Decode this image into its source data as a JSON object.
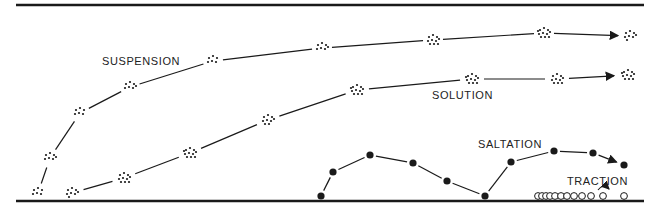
{
  "diagram": {
    "labels": {
      "suspension": "SUSPENSION",
      "solution": "SOLUTION",
      "saltation": "SALTATION",
      "traction": "TRACTION"
    },
    "colors": {
      "ink": "#1a1a1a",
      "background": "#ffffff"
    },
    "lines": {
      "top_y": 5,
      "bottom_y": 201,
      "x_start": 16,
      "x_end": 644
    },
    "suspension_clusters": [
      [
        38,
        193
      ],
      [
        50,
        158
      ],
      [
        80,
        113
      ],
      [
        130,
        87
      ],
      [
        213,
        61
      ],
      [
        322,
        48
      ],
      [
        433,
        40
      ],
      [
        544,
        33
      ],
      [
        630,
        36
      ]
    ],
    "solution_clusters": [
      [
        72,
        193
      ],
      [
        124,
        178
      ],
      [
        190,
        153
      ],
      [
        268,
        120
      ],
      [
        357,
        90
      ],
      [
        472,
        79
      ],
      [
        557,
        79
      ],
      [
        628,
        75
      ]
    ],
    "saltation_points": [
      [
        321,
        196
      ],
      [
        333,
        172
      ],
      [
        370,
        155
      ],
      [
        413,
        163
      ],
      [
        447,
        181
      ],
      [
        485,
        196
      ],
      [
        511,
        162
      ],
      [
        554,
        151
      ],
      [
        593,
        153
      ],
      [
        624,
        165
      ]
    ],
    "traction_grains": [
      [
        538,
        196
      ],
      [
        542,
        196
      ],
      [
        546,
        196
      ],
      [
        550,
        196
      ],
      [
        555,
        196
      ],
      [
        561,
        196
      ],
      [
        567,
        196
      ],
      [
        574,
        196
      ],
      [
        582,
        196
      ],
      [
        591,
        196
      ],
      [
        603,
        196
      ],
      [
        624,
        196
      ]
    ]
  }
}
